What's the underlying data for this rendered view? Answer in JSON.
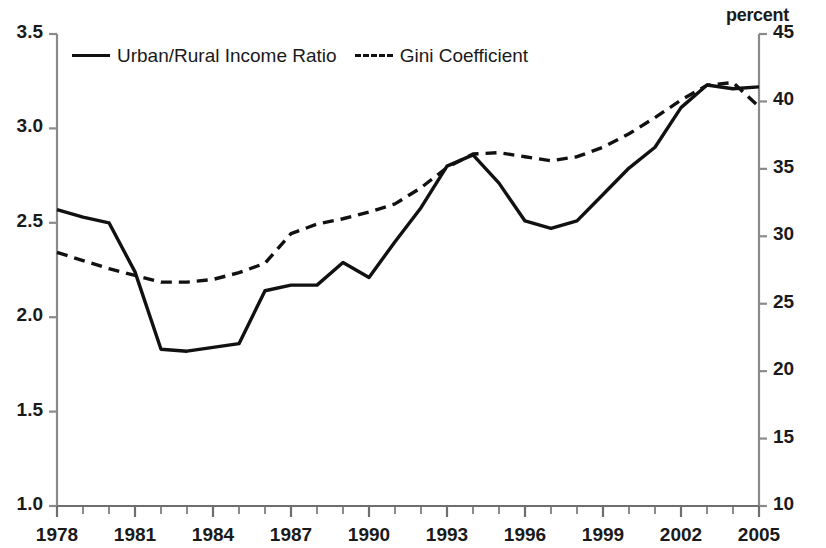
{
  "chart_data": {
    "type": "line",
    "title": "",
    "subtitle": "",
    "xlabel": "",
    "ylabel": "",
    "ylabel_right": "percent",
    "grid": false,
    "legend_position": "top-left inside plot",
    "x": [
      1978,
      1979,
      1980,
      1981,
      1982,
      1983,
      1984,
      1985,
      1986,
      1987,
      1988,
      1989,
      1990,
      1991,
      1992,
      1993,
      1994,
      1995,
      1996,
      1997,
      1998,
      1999,
      2000,
      2001,
      2002,
      2003,
      2004,
      2005
    ],
    "xlim": [
      1978,
      2005
    ],
    "x_tick_labels": [
      "1978",
      "1981",
      "1984",
      "1987",
      "1990",
      "1993",
      "1996",
      "1999",
      "2002",
      "2005"
    ],
    "x_tick_values": [
      1978,
      1981,
      1984,
      1987,
      1990,
      1993,
      1996,
      1999,
      2002,
      2005
    ],
    "y_left_tick_labels": [
      "3.5",
      "3.0",
      "2.5",
      "2.0",
      "1.5",
      "1.0"
    ],
    "y_left_tick_values": [
      3.5,
      3.0,
      2.5,
      2.0,
      1.5,
      1.0
    ],
    "ylim_left": [
      1.0,
      3.5
    ],
    "y_right_tick_labels": [
      "45",
      "40",
      "35",
      "30",
      "25",
      "20",
      "15",
      "10"
    ],
    "y_right_tick_values": [
      45,
      40,
      35,
      30,
      25,
      20,
      15,
      10
    ],
    "ylim_right": [
      10,
      45
    ],
    "series": [
      {
        "name": "Urban/Rural Income Ratio",
        "axis": "left",
        "style": "solid",
        "color": "#111111",
        "values": [
          2.57,
          2.53,
          2.5,
          2.24,
          1.83,
          1.82,
          1.84,
          1.86,
          2.14,
          2.17,
          2.17,
          2.29,
          2.21,
          2.4,
          2.58,
          2.8,
          2.86,
          2.71,
          2.51,
          2.47,
          2.51,
          2.65,
          2.79,
          2.9,
          3.11,
          3.23,
          3.21,
          3.22
        ]
      },
      {
        "name": "Gini Coefficient",
        "axis": "right",
        "style": "dashed",
        "color": "#111111",
        "values": [
          28.8,
          28.2,
          27.6,
          27.1,
          26.6,
          26.6,
          26.8,
          27.3,
          28.0,
          30.2,
          30.9,
          31.3,
          31.8,
          32.4,
          33.6,
          35.1,
          36.1,
          36.2,
          35.9,
          35.6,
          35.9,
          36.6,
          37.6,
          38.8,
          40.1,
          41.2,
          41.4,
          39.6
        ]
      }
    ]
  },
  "legend": {
    "entries": [
      {
        "label": "Urban/Rural Income Ratio",
        "style": "solid"
      },
      {
        "label": "Gini Coefficient",
        "style": "dashed"
      }
    ]
  },
  "axes": {
    "right_title": "percent"
  }
}
